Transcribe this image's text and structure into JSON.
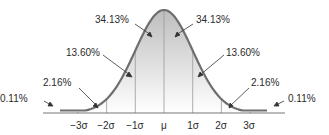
{
  "chart_data": {
    "type": "area",
    "title": "",
    "xlabel": "",
    "ylabel": "",
    "x_ticks": [
      "−3σ",
      "−2σ",
      "−1σ",
      "μ",
      "1σ",
      "2σ",
      "3σ"
    ],
    "bands": [
      {
        "range": "< −3σ",
        "percent": "0.11%"
      },
      {
        "range": "−3σ to −2σ",
        "percent": "2.16%"
      },
      {
        "range": "−2σ to −1σ",
        "percent": "13.60%"
      },
      {
        "range": "−1σ to μ",
        "percent": "34.13%"
      },
      {
        "range": "μ to 1σ",
        "percent": "34.13%"
      },
      {
        "range": "1σ to 2σ",
        "percent": "13.60%"
      },
      {
        "range": "2σ to 3σ",
        "percent": "2.16%"
      },
      {
        "range": "> 3σ",
        "percent": "0.11%"
      }
    ],
    "values": [
      0.11,
      2.16,
      13.6,
      34.13,
      34.13,
      13.6,
      2.16,
      0.11
    ],
    "grid": false,
    "legend": "none"
  },
  "labels": {
    "left_34": "34.13%",
    "right_34": "34.13%",
    "left_13": "13.60%",
    "right_13": "13.60%",
    "left_2": "2.16%",
    "right_2": "2.16%",
    "left_0": "0.11%",
    "right_0": "0.11%"
  },
  "ticks": {
    "m3": "−3σ",
    "m2": "−2σ",
    "m1": "−1σ",
    "mu": "μ",
    "p1": "1σ",
    "p2": "2σ",
    "p3": "3σ"
  },
  "colors": {
    "curve": "#6e6e6e",
    "fill_top": "#c4c4c4",
    "fill_bottom": "#ffffff",
    "axis": "#777777"
  }
}
